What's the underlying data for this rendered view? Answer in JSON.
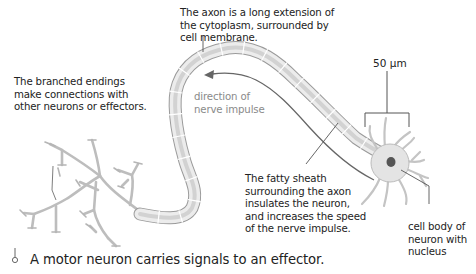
{
  "diagram": {
    "subject": "motor neuron",
    "annotations": {
      "axon": "The axon is a long extension of\nthe cytoplasm, surrounded by\ncell membrane.",
      "branched_endings": "The branched endings\nmake connections with\nother neurons or effectors.",
      "direction": "direction of\nnerve impulse",
      "sheath": "The fatty sheath\nsurrounding the axon\ninsulates the neuron,\nand increases the speed\nof the nerve impulse.",
      "cell_body": "cell body of\nneuron with\nnucleus"
    },
    "scale_bar": "50 μm",
    "caption": "A motor neuron carries signals to an effector.",
    "colors": {
      "outline": "#9a9a9a",
      "fill": "#e6e6e6",
      "inner": "#d2d2d2",
      "nucleus": "#555555",
      "leader": "#555555",
      "arrow": "#666666",
      "text": "#222222",
      "muted_text": "#8a8a8a"
    }
  }
}
